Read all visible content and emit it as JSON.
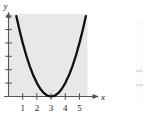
{
  "figure": {
    "kind": "cartesian-plot",
    "panel_color": "#e8e8e8",
    "background_color": "#ffffff",
    "curve_color": "#111111",
    "axis_color": "#555555",
    "label_color": "#1a1a1a",
    "y_axis_name": "y",
    "x_axis_name": "x"
  },
  "chart_data": {
    "type": "line",
    "title": "",
    "subtitle": "",
    "xlabel": "x",
    "ylabel": "y",
    "xlim": [
      -0.45,
      6.1
    ],
    "ylim": [
      -0.9,
      6.9
    ],
    "grid": false,
    "legend": null,
    "series": [
      {
        "name": "parabola",
        "equation": "y = (x - 3)^2",
        "vertex": [
          3,
          0
        ],
        "opens": "up",
        "x": [
          0.55,
          0.8,
          1.0,
          1.25,
          1.5,
          1.75,
          2.0,
          2.25,
          2.5,
          2.75,
          3.0,
          3.25,
          3.5,
          3.75,
          4.0,
          4.25,
          4.5,
          4.75,
          5.0,
          5.25,
          5.45
        ],
        "values": [
          6.0,
          4.84,
          4.0,
          3.06,
          2.25,
          1.56,
          1.0,
          0.56,
          0.25,
          0.06,
          0.0,
          0.06,
          0.25,
          0.56,
          1.0,
          1.56,
          2.25,
          3.06,
          4.0,
          5.06,
          6.0
        ]
      }
    ],
    "x_ticks": [
      1,
      2,
      3,
      4,
      5
    ],
    "x_tick_labels": [
      "1",
      "2",
      "3",
      "4",
      "5"
    ],
    "y_ticks": [
      1,
      2,
      3,
      4,
      5,
      6
    ],
    "y_tick_labels": [
      "",
      "",
      "",
      "",
      "",
      ""
    ]
  },
  "x_axis": {
    "arrow": true,
    "label": "x",
    "ticks": [
      {
        "value": 1,
        "label": "1"
      },
      {
        "value": 2,
        "label": "2"
      },
      {
        "value": 3,
        "label": "3"
      },
      {
        "value": 4,
        "label": "4"
      },
      {
        "value": 5,
        "label": "5"
      }
    ]
  },
  "y_axis": {
    "arrow": true,
    "label": "y",
    "ticks": [
      {
        "value": 1,
        "label": ""
      },
      {
        "value": 2,
        "label": ""
      },
      {
        "value": 3,
        "label": ""
      },
      {
        "value": 4,
        "label": ""
      },
      {
        "value": 5,
        "label": ""
      },
      {
        "value": 6,
        "label": ""
      }
    ]
  }
}
